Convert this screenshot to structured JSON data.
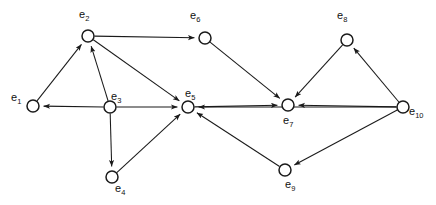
{
  "diagram": {
    "type": "directed-graph",
    "width": 436,
    "height": 205,
    "background_color": "#ffffff",
    "stroke_color": "#1a1a1a",
    "node_fill_color": "#ffffff",
    "node_radius": 6,
    "arrow_size": 6,
    "nodes": [
      {
        "id": "e1",
        "label_base": "e",
        "label_sub": "1",
        "label_text": "e1",
        "x": 33,
        "y": 106,
        "label_x": 11,
        "label_y": 92
      },
      {
        "id": "e2",
        "label_base": "e",
        "label_sub": "2",
        "label_text": "e2",
        "x": 88,
        "y": 36,
        "label_x": 79,
        "label_y": 9
      },
      {
        "id": "e3",
        "label_base": "e",
        "label_sub": "3",
        "label_text": "e3",
        "x": 110,
        "y": 107,
        "label_x": 111,
        "label_y": 91
      },
      {
        "id": "e4",
        "label_base": "e",
        "label_sub": "4",
        "label_text": "e4",
        "x": 112,
        "y": 177,
        "label_x": 115,
        "label_y": 183
      },
      {
        "id": "e5",
        "label_base": "e",
        "label_sub": "5",
        "label_text": "e5",
        "x": 188,
        "y": 107,
        "label_x": 185,
        "label_y": 88
      },
      {
        "id": "e6",
        "label_base": "e",
        "label_sub": "6",
        "label_text": "e6",
        "x": 205,
        "y": 38,
        "label_x": 190,
        "label_y": 10
      },
      {
        "id": "e7",
        "label_base": "e",
        "label_sub": "7",
        "label_text": "e7",
        "x": 288,
        "y": 105,
        "label_x": 283,
        "label_y": 115
      },
      {
        "id": "e8",
        "label_base": "e",
        "label_sub": "8",
        "label_text": "e8",
        "x": 347,
        "y": 40,
        "label_x": 337,
        "label_y": 10
      },
      {
        "id": "e9",
        "label_base": "e",
        "label_sub": "9",
        "label_text": "e9",
        "x": 285,
        "y": 170,
        "label_x": 285,
        "label_y": 179
      },
      {
        "id": "e10",
        "label_base": "e",
        "label_sub": "10",
        "label_text": "e10",
        "x": 403,
        "y": 107,
        "label_x": 409,
        "label_y": 106
      }
    ],
    "edges": [
      {
        "from": "e1",
        "to": "e2",
        "directed": true
      },
      {
        "from": "e3",
        "to": "e2",
        "directed": true
      },
      {
        "from": "e3",
        "to": "e1",
        "directed": true
      },
      {
        "from": "e3",
        "to": "e5",
        "directed": true
      },
      {
        "from": "e3",
        "to": "e4",
        "directed": true
      },
      {
        "from": "e2",
        "to": "e6",
        "directed": true
      },
      {
        "from": "e2",
        "to": "e5",
        "directed": true
      },
      {
        "from": "e6",
        "to": "e7",
        "directed": true
      },
      {
        "from": "e4",
        "to": "e5",
        "directed": true
      },
      {
        "from": "e5",
        "to": "e7",
        "directed": true
      },
      {
        "from": "e8",
        "to": "e7",
        "directed": true
      },
      {
        "from": "e10",
        "to": "e8",
        "directed": true
      },
      {
        "from": "e10",
        "to": "e7",
        "directed": true
      },
      {
        "from": "e10",
        "to": "e9",
        "directed": true
      },
      {
        "from": "e10",
        "to": "e5",
        "directed": true
      },
      {
        "from": "e9",
        "to": "e5",
        "directed": true
      }
    ]
  }
}
